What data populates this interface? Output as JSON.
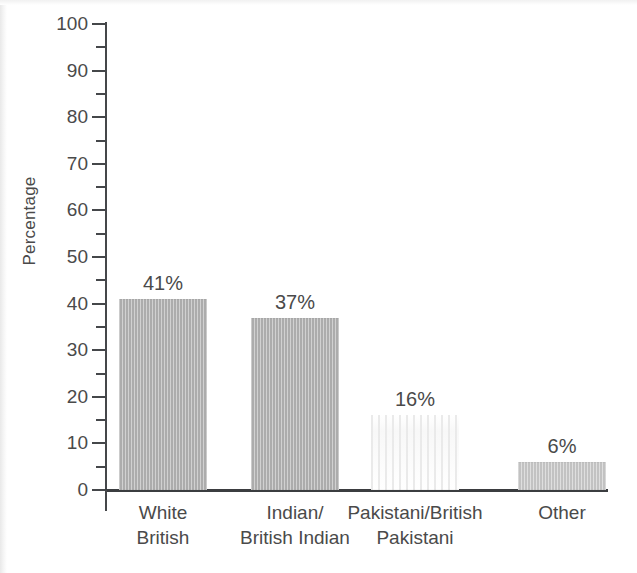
{
  "chart_data": {
    "type": "bar",
    "title": "",
    "xlabel": "",
    "ylabel": "Percentage",
    "ylim": [
      0,
      100
    ],
    "ytick_step": 10,
    "yminor_step": 5,
    "grid": false,
    "legend": null,
    "categories": [
      "White British",
      "Indian/ British Indian",
      "Pakistani/British Pakistani",
      "Other"
    ],
    "category_lines": [
      [
        "White",
        "British"
      ],
      [
        "Indian/",
        "British Indian"
      ],
      [
        "Pakistani/British",
        "Pakistani"
      ],
      [
        "Other",
        ""
      ]
    ],
    "values": [
      41,
      37,
      16,
      6
    ],
    "data_labels": [
      "41%",
      "37%",
      "16%",
      "6%"
    ],
    "ytick_labels": [
      "0",
      "10",
      "20",
      "30",
      "40",
      "50",
      "60",
      "70",
      "80",
      "90",
      "100"
    ],
    "bar_colors": [
      "#b2b2b2",
      "#b2b2b2",
      "#fbfbfb",
      "#c9c9c9"
    ]
  },
  "axis": {
    "y_label": "Percentage",
    "y_ticks": [
      {
        "value": 100,
        "label": "100"
      },
      {
        "value": 95,
        "label": ""
      },
      {
        "value": 90,
        "label": "90"
      },
      {
        "value": 85,
        "label": ""
      },
      {
        "value": 80,
        "label": "80"
      },
      {
        "value": 75,
        "label": ""
      },
      {
        "value": 70,
        "label": "70"
      },
      {
        "value": 65,
        "label": ""
      },
      {
        "value": 60,
        "label": "60"
      },
      {
        "value": 55,
        "label": ""
      },
      {
        "value": 50,
        "label": "50"
      },
      {
        "value": 45,
        "label": ""
      },
      {
        "value": 40,
        "label": "40"
      },
      {
        "value": 35,
        "label": ""
      },
      {
        "value": 30,
        "label": "30"
      },
      {
        "value": 25,
        "label": ""
      },
      {
        "value": 20,
        "label": "20"
      },
      {
        "value": 15,
        "label": ""
      },
      {
        "value": 10,
        "label": "10"
      },
      {
        "value": 5,
        "label": ""
      },
      {
        "value": 0,
        "label": "0"
      }
    ]
  },
  "bars": [
    {
      "value": 41,
      "label": "41%",
      "category_line1": "White",
      "category_line2": "British",
      "style": "solid"
    },
    {
      "value": 37,
      "label": "37%",
      "category_line1": "Indian/",
      "category_line2": "British Indian",
      "style": "solid"
    },
    {
      "value": 16,
      "label": "16%",
      "category_line1": "Pakistani/British",
      "category_line2": "Pakistani",
      "style": "ghost"
    },
    {
      "value": 6,
      "label": "6%",
      "category_line1": "Other",
      "category_line2": "",
      "style": "light"
    }
  ],
  "colors": {
    "bar_primary": "#b2b2b2",
    "bar_light": "#c9c9c9",
    "axis": "#3b3d40",
    "text": "#4a4a4a",
    "background": "#ffffff"
  }
}
